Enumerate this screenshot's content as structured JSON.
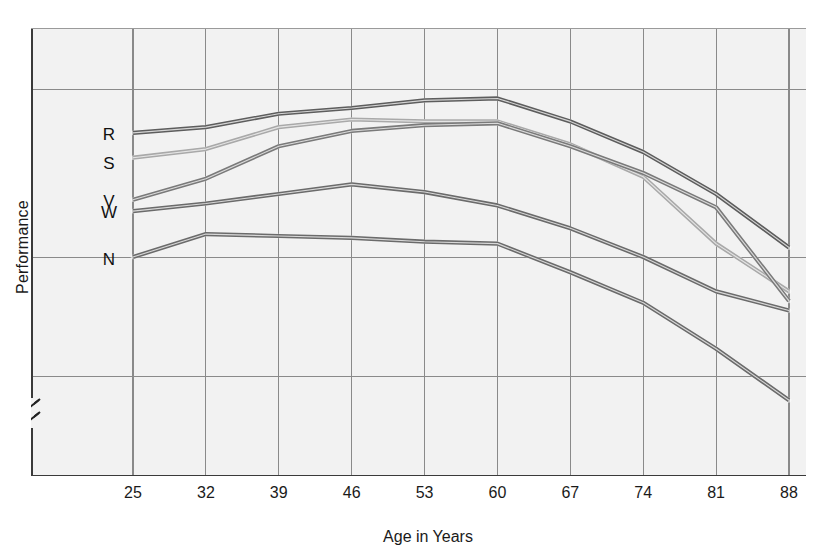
{
  "chart_data": {
    "type": "line",
    "title": "",
    "xlabel": "Age in Years",
    "ylabel": "Performance",
    "categories": [
      25,
      32,
      39,
      46,
      53,
      60,
      67,
      74,
      81,
      88
    ],
    "x": [
      25,
      32,
      39,
      46,
      53,
      60,
      67,
      74,
      81,
      88
    ],
    "xlim": [
      25,
      88
    ],
    "ylim": [
      0,
      100
    ],
    "grid": true,
    "legend_position": "inline-left",
    "axis_break": true,
    "axis_break_note": "y-axis broken near the bottom (double slash)",
    "series": [
      {
        "name": "R",
        "label": "R",
        "color": "#5d5d5d",
        "values": [
          53.0,
          53.6,
          55.0,
          55.6,
          56.4,
          56.6,
          54.2,
          51.0,
          46.6,
          41.0
        ]
      },
      {
        "name": "S",
        "label": "S",
        "color": "#a9a9a9",
        "values": [
          50.4,
          51.3,
          53.6,
          54.4,
          54.2,
          54.2,
          51.8,
          48.4,
          41.4,
          36.4
        ]
      },
      {
        "name": "V",
        "label": "V",
        "color": "#7a7a7a",
        "values": [
          46.0,
          48.2,
          51.6,
          53.2,
          53.8,
          54.0,
          51.6,
          48.8,
          45.2,
          35.4
        ]
      },
      {
        "name": "W",
        "label": "W",
        "color": "#6b6b6b",
        "values": [
          44.8,
          45.6,
          46.6,
          47.6,
          46.8,
          45.4,
          43.0,
          40.0,
          36.4,
          34.4
        ]
      },
      {
        "name": "N",
        "label": "N",
        "color": "#6b6b6b",
        "values": [
          40.0,
          42.4,
          42.2,
          42.0,
          41.6,
          41.4,
          38.4,
          35.2,
          30.4,
          25.0
        ]
      }
    ],
    "series_letter_labels": [
      "R",
      "S",
      "V",
      "W",
      "N"
    ],
    "x_tick_labels": [
      "25",
      "32",
      "39",
      "46",
      "53",
      "60",
      "67",
      "74",
      "81",
      "88"
    ],
    "colors": {
      "plot_background": "#f2f2f2",
      "grid_minor": "#b9b9b9",
      "grid_major": "#8a8a8a",
      "axis": "#3a3a3a",
      "text": "#1a1a1a"
    }
  }
}
